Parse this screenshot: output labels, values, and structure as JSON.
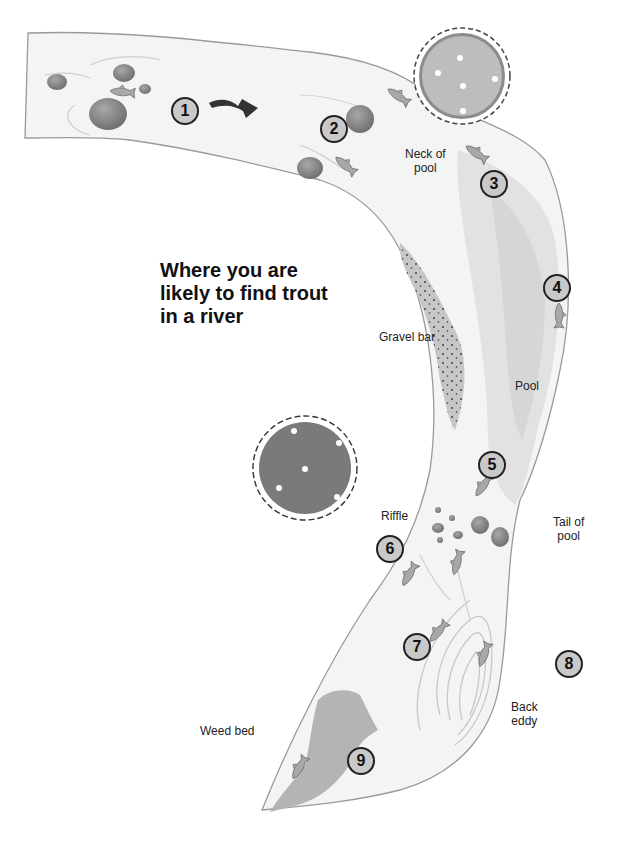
{
  "title": "Where you are likely to find trout in a river",
  "title_lines": [
    "Where you are",
    "likely to find trout",
    "in a river"
  ],
  "colors": {
    "background": "#ffffff",
    "river": "#f4f4f4",
    "pool": "#e2e2e2",
    "pool_deep": "#d6d6d6",
    "bank_edge": "#9a9a9a",
    "rock": "#8a8a8a",
    "gravel": "#c4c4c4",
    "weed": "#b4b4b4",
    "tree_canopy": "#8c8c8c",
    "fish": "#a8a8a8",
    "marker_fill": "#c9c9c9",
    "marker_border": "#222222",
    "arrow": "#333333"
  },
  "labels": {
    "neck_of_pool": "Neck of\npool",
    "neck_of_pool_lines": [
      "Neck of",
      "pool"
    ],
    "gravel_bar": "Gravel bar",
    "pool": "Pool",
    "riffle": "Riffle",
    "tail_of_pool_lines": [
      "Tail of",
      "pool"
    ],
    "back_eddy_lines": [
      "Back",
      "eddy"
    ],
    "weed_bed": "Weed bed"
  },
  "markers": [
    {
      "number": "1",
      "x": 185,
      "y": 111
    },
    {
      "number": "2",
      "x": 334,
      "y": 129
    },
    {
      "number": "3",
      "x": 494,
      "y": 184
    },
    {
      "number": "4",
      "x": 557,
      "y": 288
    },
    {
      "number": "5",
      "x": 492,
      "y": 465
    },
    {
      "number": "6",
      "x": 390,
      "y": 549
    },
    {
      "number": "7",
      "x": 417,
      "y": 647
    },
    {
      "number": "8",
      "x": 569,
      "y": 664
    },
    {
      "number": "9",
      "x": 361,
      "y": 761
    }
  ],
  "flow_arrow": {
    "icon": "wavy-flow-arrow-icon",
    "x": 245,
    "y": 110
  }
}
